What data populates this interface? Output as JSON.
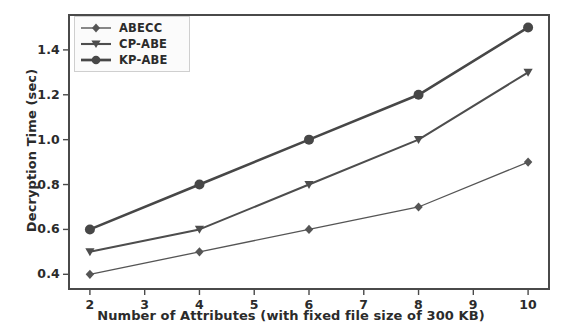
{
  "chart_data": {
    "type": "line",
    "title": "",
    "xlabel": "Number of Attributes (with fixed file size of 300 KB)",
    "ylabel": "Decryption Time (sec)",
    "x": [
      2,
      4,
      6,
      8,
      10
    ],
    "xticks": [
      "2",
      "3",
      "4",
      "5",
      "6",
      "7",
      "8",
      "9",
      "10"
    ],
    "xtick_values": [
      2,
      3,
      4,
      5,
      6,
      7,
      8,
      9,
      10
    ],
    "yticks": [
      "0.4",
      "0.6",
      "0.8",
      "1.0",
      "1.2",
      "1.4"
    ],
    "ytick_values": [
      0.4,
      0.6,
      0.8,
      1.0,
      1.2,
      1.4
    ],
    "xlim": [
      1.6,
      10.4
    ],
    "ylim": [
      0.33,
      1.56
    ],
    "grid": false,
    "legend_position": "upper left",
    "series": [
      {
        "name": "ABECC",
        "values": [
          0.4,
          0.5,
          0.6,
          0.7,
          0.9
        ],
        "marker": "diamond",
        "color": "#555555",
        "line_width": 1.3
      },
      {
        "name": "CP-ABE",
        "values": [
          0.5,
          0.6,
          0.8,
          1.0,
          1.3
        ],
        "marker": "triangle-down",
        "color": "#4d4d4d",
        "line_width": 2.0
      },
      {
        "name": "KP-ABE",
        "values": [
          0.6,
          0.8,
          1.0,
          1.2,
          1.5
        ],
        "marker": "circle",
        "color": "#474747",
        "line_width": 2.6
      }
    ]
  },
  "axis": {
    "frame_color": "#4a4a4a",
    "tick_color": "#4a4a4a",
    "text_color": "#2b2b2b"
  },
  "legend": {
    "entries": [
      "ABECC",
      "CP-ABE",
      "KP-ABE"
    ]
  }
}
